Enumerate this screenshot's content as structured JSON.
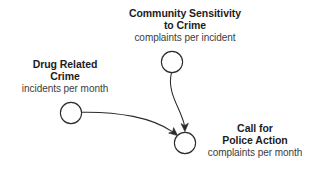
{
  "diagram": {
    "type": "causal-loop-diagram",
    "background_color": "#ffffff",
    "stroke_color": "#2b2b2b",
    "title_color": "#1d1d1d",
    "units_color": "#3c3c3c",
    "nodes": [
      {
        "id": "community-sensitivity-to-crime",
        "title_line_1": "Community Sensitivity",
        "title_line_2": "to Crime",
        "units": "complaints per incident",
        "circle": {
          "cx": 172,
          "cy": 62,
          "r": 11
        }
      },
      {
        "id": "drug-related-crime",
        "title_line_1": "Drug Related",
        "title_line_2": "Crime",
        "units": "incidents per month",
        "circle": {
          "cx": 71,
          "cy": 113,
          "r": 11
        }
      },
      {
        "id": "call-for-police-action",
        "title_line_1": "Call for",
        "title_line_2": "Police Action",
        "units": "complaints per month",
        "circle": {
          "cx": 185,
          "cy": 143,
          "r": 11
        }
      }
    ],
    "links": [
      {
        "id": "sensitivity-to-police-action",
        "from": "community-sensitivity-to-crime",
        "to": "call-for-police-action",
        "shape": "curved-arrow-downward"
      },
      {
        "id": "crime-to-police-action",
        "from": "drug-related-crime",
        "to": "call-for-police-action",
        "shape": "curved-arrow-rightward"
      }
    ]
  }
}
